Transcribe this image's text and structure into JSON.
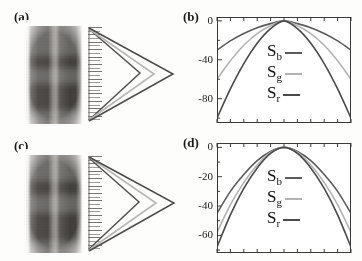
{
  "figure": {
    "width": 362,
    "height": 261,
    "background": "#fdfdfc",
    "panels": [
      {
        "id": "a",
        "label": "(a)",
        "kind": "image"
      },
      {
        "id": "b",
        "label": "(b)",
        "kind": "plot"
      },
      {
        "id": "c",
        "label": "(c)",
        "kind": "image"
      },
      {
        "id": "d",
        "label": "(d)",
        "kind": "plot"
      }
    ]
  },
  "colors": {
    "curve_b": "#5b5b5e",
    "curve_g": "#b3b3b3",
    "curve_r": "#4a4a4a",
    "axis": "#3a3a3a",
    "text": "#1a1a1a",
    "photo_dark": "#45423e",
    "photo_light": "#f2f0ee"
  },
  "legend": {
    "entries": [
      {
        "key": "b",
        "base": "S",
        "sub": "b",
        "color": "#5b5b5e"
      },
      {
        "key": "g",
        "base": "S",
        "sub": "g",
        "color": "#b3b3b3"
      },
      {
        "key": "r",
        "base": "S",
        "sub": "r",
        "color": "#4a4a4a"
      }
    ]
  },
  "chart_data": [
    {
      "panel": "b",
      "type": "line",
      "title": "",
      "xlabel": "",
      "ylabel": "",
      "xlim": [
        -1,
        1
      ],
      "ylim": [
        -105,
        4
      ],
      "ytick_labels": [
        "0",
        "-40",
        "-80"
      ],
      "ytick_values": [
        0,
        -40,
        -80
      ],
      "xtick_count": 11,
      "grid": false,
      "legend_position": "center",
      "series": [
        {
          "name": "S_b",
          "color": "#5b5b5e",
          "x": [
            -1.0,
            -0.8,
            -0.6,
            -0.4,
            -0.2,
            0.0,
            0.2,
            0.4,
            0.6,
            0.8,
            1.0
          ],
          "values": [
            -30,
            -20.5,
            -13,
            -7,
            -2.8,
            0,
            -2.8,
            -7,
            -13,
            -20.5,
            -30
          ]
        },
        {
          "name": "S_g",
          "color": "#b3b3b3",
          "x": [
            -1.0,
            -0.8,
            -0.6,
            -0.4,
            -0.2,
            0.0,
            0.2,
            0.4,
            0.6,
            0.8,
            1.0
          ],
          "values": [
            -60,
            -41,
            -25,
            -13,
            -5,
            0,
            -5,
            -13,
            -25,
            -41,
            -60
          ]
        },
        {
          "name": "S_r",
          "color": "#4a4a4a",
          "x": [
            -1.0,
            -0.8,
            -0.6,
            -0.4,
            -0.2,
            0.0,
            0.2,
            0.4,
            0.6,
            0.8,
            1.0
          ],
          "values": [
            -100,
            -70,
            -44,
            -23,
            -8,
            0,
            -8,
            -23,
            -44,
            -70,
            -100
          ]
        }
      ]
    },
    {
      "panel": "d",
      "type": "line",
      "title": "",
      "xlabel": "",
      "ylabel": "",
      "xlim": [
        -1,
        1
      ],
      "ylim": [
        -72,
        3
      ],
      "ytick_labels": [
        "0",
        "-20",
        "-40",
        "-60"
      ],
      "ytick_values": [
        0,
        -20,
        -40,
        -60
      ],
      "xtick_count": 11,
      "grid": false,
      "legend_position": "center",
      "series": [
        {
          "name": "S_b",
          "color": "#5b5b5e",
          "x": [
            -1.0,
            -0.8,
            -0.6,
            -0.4,
            -0.2,
            0.0,
            0.2,
            0.4,
            0.6,
            0.8,
            1.0
          ],
          "values": [
            -45,
            -30,
            -18.5,
            -9,
            -2.8,
            0,
            -2.8,
            -9,
            -18.5,
            -30,
            -45
          ]
        },
        {
          "name": "S_g",
          "color": "#b3b3b3",
          "x": [
            -1.0,
            -0.8,
            -0.6,
            -0.4,
            -0.2,
            0.0,
            0.2,
            0.4,
            0.6,
            0.8,
            1.0
          ],
          "values": [
            -58,
            -39,
            -24,
            -12,
            -3.5,
            0,
            -3.5,
            -12,
            -24,
            -39,
            -58
          ]
        },
        {
          "name": "S_r",
          "color": "#4a4a4a",
          "x": [
            -1.0,
            -0.8,
            -0.6,
            -0.4,
            -0.2,
            0.0,
            0.2,
            0.4,
            0.6,
            0.8,
            1.0
          ],
          "values": [
            -68,
            -46,
            -28,
            -14,
            -4,
            0,
            -4,
            -14,
            -28,
            -46,
            -68
          ]
        }
      ]
    }
  ],
  "images": {
    "a": {
      "comb_teeth": 26,
      "fan_lines": 3,
      "description": "two dark vertical bands with comb grating and nested chevrons"
    },
    "c": {
      "comb_teeth": 26,
      "fan_lines": 3,
      "description": "two dark vertical bands with comb grating and nested chevrons"
    }
  }
}
